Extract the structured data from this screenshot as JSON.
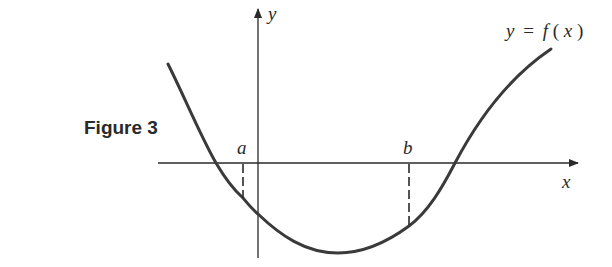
{
  "figure": {
    "label": "Figure 3",
    "axes": {
      "x_label": "x",
      "y_label": "y"
    },
    "curve_label": {
      "y": "y",
      "eq": "=",
      "f": "f",
      "open": "(",
      "x": "x",
      "close": ")"
    },
    "points": [
      {
        "name": "a",
        "label": "a"
      },
      {
        "name": "b",
        "label": "b"
      }
    ],
    "colors": {
      "ink": "#2a2a2a",
      "curve": "#3a3a3a",
      "background": "#ffffff"
    }
  }
}
